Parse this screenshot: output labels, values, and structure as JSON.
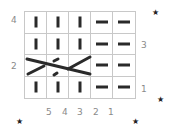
{
  "chart": {
    "columns": 5,
    "rows": 4,
    "grid": [
      [
        "knit",
        "knit",
        "knit",
        "purl",
        "purl"
      ],
      [
        "knit",
        "knit",
        "knit",
        "purl",
        "purl"
      ],
      [
        "cable",
        "cable",
        "cable",
        "purl",
        "purl"
      ],
      [
        "knit",
        "knit",
        "knit",
        "purl",
        "purl"
      ]
    ],
    "column_labels": [
      "5",
      "4",
      "3",
      "2",
      "1"
    ],
    "row_labels_left": [
      {
        "row": 4,
        "label": "4"
      },
      {
        "row": 2,
        "label": "2"
      }
    ],
    "row_labels_right": [
      {
        "row": 3,
        "label": "3"
      },
      {
        "row": 1,
        "label": "1"
      }
    ],
    "cable": {
      "row": 2,
      "span_columns": [
        5,
        4,
        3
      ],
      "description": "3-stitch cable crossing"
    }
  },
  "colors": {
    "stitch": "#2a2a2a",
    "grid": "#c8c8c8",
    "label": "#8a8a8a"
  },
  "decorations": {
    "stars": 4
  }
}
